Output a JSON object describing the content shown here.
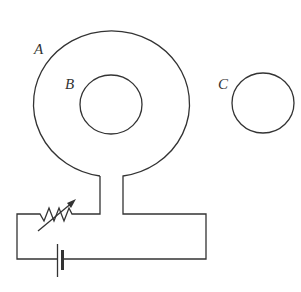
{
  "diagram": {
    "type": "physics-circuit",
    "labels": {
      "loop_a": "A",
      "ring_b": "B",
      "ring_c": "C"
    },
    "components": [
      {
        "id": "A",
        "kind": "conducting loop connected to circuit"
      },
      {
        "id": "B",
        "kind": "conducting ring inside loop A"
      },
      {
        "id": "C",
        "kind": "conducting ring outside loop A"
      },
      {
        "kind": "variable resistor (rheostat)"
      },
      {
        "kind": "battery"
      }
    ],
    "colors": {
      "stroke": "#333333",
      "background": "#ffffff"
    }
  }
}
